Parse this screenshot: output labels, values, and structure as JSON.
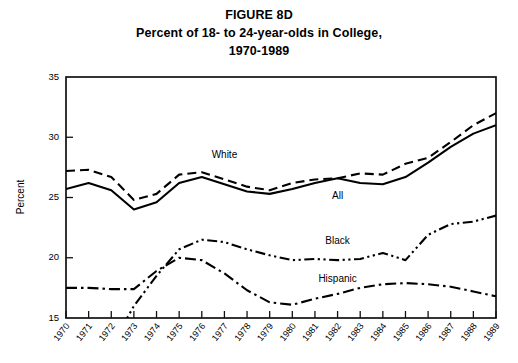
{
  "figure": {
    "title_lines": [
      "FIGURE 8D",
      "Percent of 18- to 24-year-olds in College,",
      "1970-1989"
    ]
  },
  "chart_data": {
    "type": "line",
    "title": "FIGURE 8D Percent of 18- to 24-year-olds in College, 1970-1989",
    "xlabel": "",
    "ylabel": "Percent",
    "ylim": [
      15,
      35
    ],
    "yticks": [
      15,
      20,
      25,
      30,
      35
    ],
    "grid": false,
    "legend_position": "inline-labels",
    "categories": [
      "1970",
      "1971",
      "1972",
      "1973",
      "1974",
      "1975",
      "1976",
      "1977",
      "1978",
      "1979",
      "1980",
      "1981",
      "1982",
      "1983",
      "1984",
      "1985",
      "1986",
      "1987",
      "1988",
      "1989"
    ],
    "series": [
      {
        "name": "White",
        "line_style": "dashed",
        "label_x_category": "1977",
        "label_value": 28.3,
        "values": [
          27.2,
          27.3,
          26.7,
          24.8,
          25.3,
          26.9,
          27.1,
          26.5,
          25.9,
          25.6,
          26.2,
          26.5,
          26.6,
          27.0,
          26.9,
          27.8,
          28.3,
          29.6,
          31.0,
          32.0
        ]
      },
      {
        "name": "All",
        "line_style": "solid",
        "label_x_category": "1982",
        "label_value": 24.9,
        "values": [
          25.7,
          26.2,
          25.6,
          24.0,
          24.6,
          26.2,
          26.7,
          26.1,
          25.5,
          25.3,
          25.7,
          26.2,
          26.6,
          26.2,
          26.1,
          26.7,
          27.9,
          29.2,
          30.3,
          31.0
        ]
      },
      {
        "name": "Black",
        "line_style": "dash-dot-dot",
        "label_x_category": "1982",
        "label_value": 21.1,
        "values": [
          null,
          null,
          null,
          16.0,
          18.5,
          20.7,
          21.5,
          21.3,
          20.7,
          20.2,
          19.8,
          19.9,
          19.8,
          19.9,
          20.4,
          19.8,
          21.9,
          22.8,
          23.0,
          23.5
        ]
      },
      {
        "name": "Hispanic",
        "line_style": "dash-dot",
        "label_x_category": "1982",
        "label_value": 18.0,
        "values": [
          17.5,
          17.5,
          17.4,
          17.4,
          18.9,
          20.0,
          19.8,
          18.7,
          17.3,
          16.3,
          16.1,
          16.6,
          17.0,
          17.5,
          17.8,
          17.9,
          17.8,
          17.6,
          17.2,
          16.8
        ]
      }
    ]
  }
}
